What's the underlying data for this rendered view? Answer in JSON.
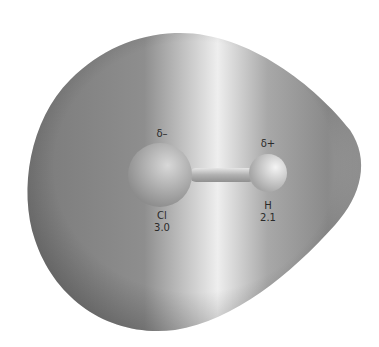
{
  "diagram": {
    "molecule": "HCl",
    "surface": "electrostatic potential surface",
    "atoms": [
      {
        "symbol": "Cl",
        "electronegativity": "3.0",
        "partial_charge": "δ–"
      },
      {
        "symbol": "H",
        "electronegativity": "2.1",
        "partial_charge": "δ+"
      }
    ],
    "colors": {
      "surface_dark": "#6f6f6f",
      "surface_light": "#f2f2f2",
      "atom": "#b8b8b8"
    }
  }
}
